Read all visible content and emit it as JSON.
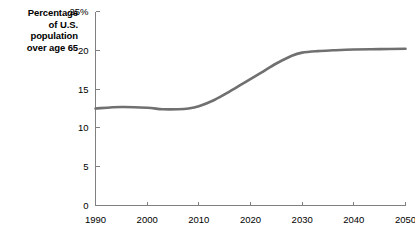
{
  "chart_data": {
    "type": "line",
    "title": "Percentage of U.S. population over age 65",
    "title_lines": [
      "Percentage",
      "of U.S.",
      "population",
      "over age 65"
    ],
    "xlabel": "",
    "ylabel": "",
    "xlim": [
      1990,
      2050
    ],
    "ylim": [
      0,
      25
    ],
    "grid": false,
    "legend": false,
    "legend_position": "none",
    "y_ticks": [
      0,
      5,
      10,
      15,
      20,
      25
    ],
    "y_tick_labels": [
      "0",
      "5",
      "10",
      "15",
      "20",
      "25%"
    ],
    "x_ticks": [
      1990,
      2000,
      2010,
      2020,
      2030,
      2040,
      2050
    ],
    "x_tick_labels": [
      "1990",
      "2000",
      "2010",
      "2020",
      "2030",
      "2040",
      "2050"
    ],
    "line_color": "#707070",
    "axis_color": "#808080",
    "background_color": "#ffffff",
    "x": [
      1990,
      1995,
      2000,
      2003,
      2006,
      2008,
      2010,
      2013,
      2016,
      2019,
      2022,
      2025,
      2028,
      2030,
      2033,
      2036,
      2040,
      2045,
      2050
    ],
    "values": [
      12.5,
      12.7,
      12.6,
      12.4,
      12.4,
      12.5,
      12.8,
      13.6,
      14.7,
      15.9,
      17.1,
      18.3,
      19.3,
      19.7,
      19.9,
      20.0,
      20.1,
      20.15,
      20.2
    ],
    "series": [
      {
        "name": "Percentage of U.S. population over age 65",
        "values": [
          12.5,
          12.7,
          12.6,
          12.4,
          12.4,
          12.5,
          12.8,
          13.6,
          14.7,
          15.9,
          17.1,
          18.3,
          19.3,
          19.7,
          19.9,
          20.0,
          20.1,
          20.15,
          20.2
        ]
      }
    ]
  }
}
